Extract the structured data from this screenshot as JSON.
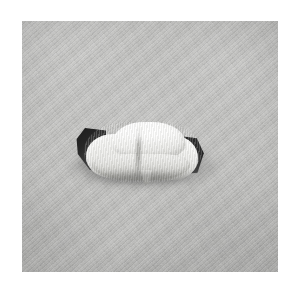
{
  "page": {
    "background_color": "#ffffff",
    "width": 300,
    "height": 292
  },
  "photograph": {
    "name": "wrapped-white-bundle-photo",
    "description": "Grayscale photograph of a small white rolled cloth bundle resting on a textured gray woven fabric surface",
    "color_mode": "grayscale",
    "plate": {
      "left": 22,
      "top": 21,
      "width": 256,
      "height": 251,
      "border_color": "#ffffff"
    },
    "background_surface": {
      "name": "woven-fabric-backdrop",
      "material": "diagonal twill woven cloth",
      "base_color": "#bbbbb9",
      "light_tone": "#c6c6c4",
      "dark_tone": "#a9a9a7",
      "weave_direction": "diagonal",
      "weave_angle_degrees": -42
    },
    "subject": {
      "name": "rolled-white-fabric-bundle",
      "form": "cylindrical roll wrapped in white cloth",
      "highlight_color": "#ffffff",
      "midtone_color": "#e4e4e1",
      "shadow_color": "#ababa7",
      "bounds": {
        "left": 54,
        "top": 99,
        "width": 130,
        "height": 62
      },
      "features": [
        {
          "name": "dark-end-left",
          "color": "#1d1d1d",
          "description": "dark wedge of material exposed at the left end of the roll"
        },
        {
          "name": "dark-end-right",
          "color": "#1a1a1a",
          "description": "dark wedge of material exposed at the right end of the roll"
        },
        {
          "name": "center-crease",
          "color": "#8c8c88",
          "description": "vertical fold line where the two wraps overlap"
        },
        {
          "name": "hanging-tail",
          "color": "#cfcfcb",
          "description": "small flap of cloth hanging below the center"
        },
        {
          "name": "top-highlight",
          "color": "#ffffff",
          "description": "specular highlight along the upper curve of the roll"
        }
      ]
    },
    "cast_shadow": {
      "name": "bundle-cast-shadow",
      "color": "#3a3a3a",
      "direction": "below and slightly right",
      "softness": "soft diffuse"
    }
  }
}
